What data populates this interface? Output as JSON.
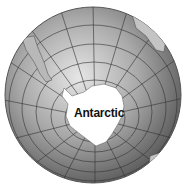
{
  "map": {
    "type": "orthographic-globe",
    "center": "South Pole",
    "label": "Antarctic",
    "colors": {
      "ocean_light": "#d8d8d8",
      "ocean_dark": "#6a6a6a",
      "land": "#ffffff",
      "graticule": "#3a3a3a",
      "outline": "#555555"
    }
  }
}
